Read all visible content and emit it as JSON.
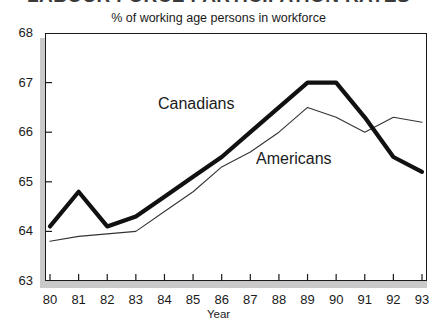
{
  "headline": "LABOUR FORCE PARTICIPATION RATES",
  "subtitle": "% of working age persons in workforce",
  "xaxis_title": "Year",
  "series_labels": {
    "canadians": "Canadians",
    "americans": "Americans"
  },
  "colors": {
    "canadians_line": "#111111",
    "americans_line": "#333333",
    "frame": "#1a1a1a",
    "shadow": "#c9c9c9",
    "background": "#ffffff"
  },
  "chart_data": {
    "type": "line",
    "title": "LABOUR FORCE PARTICIPATION RATES",
    "subtitle": "% of working age persons in workforce",
    "xlabel": "Year",
    "ylabel": "",
    "categories": [
      "80",
      "81",
      "82",
      "83",
      "84",
      "85",
      "86",
      "87",
      "88",
      "89",
      "90",
      "91",
      "92",
      "93"
    ],
    "x": [
      80,
      81,
      82,
      83,
      84,
      85,
      86,
      87,
      88,
      89,
      90,
      91,
      92,
      93
    ],
    "ylim": [
      63,
      68
    ],
    "yticks": [
      63,
      64,
      65,
      66,
      67,
      68
    ],
    "xlim": [
      80,
      93
    ],
    "grid": false,
    "legend": "inline-annotations",
    "series": [
      {
        "name": "Canadians",
        "style": "thick",
        "values": [
          64.1,
          64.8,
          64.1,
          64.3,
          64.7,
          65.1,
          65.5,
          66.0,
          66.5,
          67.0,
          67.0,
          66.3,
          65.5,
          65.2
        ]
      },
      {
        "name": "Americans",
        "style": "thin",
        "values": [
          63.8,
          63.9,
          63.95,
          64.0,
          64.4,
          64.8,
          65.3,
          65.6,
          66.0,
          66.5,
          66.3,
          66.0,
          66.3,
          66.2
        ]
      }
    ]
  }
}
